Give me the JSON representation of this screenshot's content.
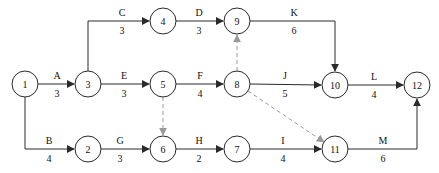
{
  "diagram": {
    "type": "activity-on-arrow-network",
    "width": 439,
    "height": 173,
    "colors": {
      "background": "#ffffff",
      "node_fill": "#ffffff",
      "solid_stroke": "#2a2a2a",
      "dashed_stroke": "#9a9a9a",
      "text": "#111111"
    },
    "node_radius": 13,
    "nodes": [
      {
        "id": "1",
        "x": 25,
        "y": 84
      },
      {
        "id": "2",
        "x": 88,
        "y": 149
      },
      {
        "id": "3",
        "x": 88,
        "y": 84
      },
      {
        "id": "4",
        "x": 163,
        "y": 21
      },
      {
        "id": "5",
        "x": 163,
        "y": 84
      },
      {
        "id": "6",
        "x": 163,
        "y": 149
      },
      {
        "id": "7",
        "x": 237,
        "y": 149
      },
      {
        "id": "8",
        "x": 237,
        "y": 84
      },
      {
        "id": "9",
        "x": 237,
        "y": 21
      },
      {
        "id": "10",
        "x": 335,
        "y": 85
      },
      {
        "id": "11",
        "x": 335,
        "y": 149
      },
      {
        "id": "12",
        "x": 417,
        "y": 85
      }
    ],
    "edges": [
      {
        "activity": "A",
        "duration": "3",
        "from": "1",
        "to": "3",
        "style": "solid",
        "points": [
          [
            38,
            84
          ],
          [
            74,
            84
          ]
        ],
        "label_x": 57,
        "label_line_y": 84
      },
      {
        "activity": "B",
        "duration": "4",
        "from": "1",
        "to": "2",
        "style": "solid",
        "points": [
          [
            25,
            97
          ],
          [
            25,
            149
          ],
          [
            74,
            149
          ]
        ],
        "label_x": 49,
        "label_line_y": 149
      },
      {
        "activity": "C",
        "duration": "3",
        "from": "3",
        "to": "4",
        "style": "solid",
        "points": [
          [
            88,
            71
          ],
          [
            88,
            21
          ],
          [
            149,
            21
          ]
        ],
        "label_x": 122,
        "label_line_y": 21
      },
      {
        "activity": "D",
        "duration": "3",
        "from": "4",
        "to": "9",
        "style": "solid",
        "points": [
          [
            176,
            21
          ],
          [
            223,
            21
          ]
        ],
        "label_x": 199,
        "label_line_y": 21
      },
      {
        "activity": "E",
        "duration": "3",
        "from": "3",
        "to": "5",
        "style": "solid",
        "points": [
          [
            101,
            84
          ],
          [
            149,
            84
          ]
        ],
        "label_x": 124,
        "label_line_y": 84
      },
      {
        "activity": "F",
        "duration": "4",
        "from": "5",
        "to": "8",
        "style": "solid",
        "points": [
          [
            176,
            84
          ],
          [
            223,
            84
          ]
        ],
        "label_x": 200,
        "label_line_y": 84
      },
      {
        "activity": "G",
        "duration": "3",
        "from": "2",
        "to": "6",
        "style": "solid",
        "points": [
          [
            101,
            149
          ],
          [
            149,
            149
          ]
        ],
        "label_x": 120,
        "label_line_y": 149
      },
      {
        "activity": "H",
        "duration": "2",
        "from": "6",
        "to": "7",
        "style": "solid",
        "points": [
          [
            176,
            149
          ],
          [
            223,
            149
          ]
        ],
        "label_x": 199,
        "label_line_y": 149
      },
      {
        "activity": "I",
        "duration": "4",
        "from": "7",
        "to": "11",
        "style": "solid",
        "points": [
          [
            250,
            149
          ],
          [
            321,
            149
          ]
        ],
        "label_x": 283,
        "label_line_y": 149
      },
      {
        "activity": "J",
        "duration": "5",
        "from": "8",
        "to": "10",
        "style": "solid",
        "points": [
          [
            250,
            84
          ],
          [
            321,
            85
          ]
        ],
        "label_x": 285,
        "label_line_y": 84
      },
      {
        "activity": "K",
        "duration": "6",
        "from": "9",
        "to": "10",
        "style": "solid",
        "points": [
          [
            250,
            21
          ],
          [
            335,
            21
          ],
          [
            335,
            71
          ]
        ],
        "label_x": 294,
        "label_line_y": 21
      },
      {
        "activity": "L",
        "duration": "4",
        "from": "10",
        "to": "12",
        "style": "solid",
        "points": [
          [
            348,
            85
          ],
          [
            403,
            85
          ]
        ],
        "label_x": 374,
        "label_line_y": 85
      },
      {
        "activity": "M",
        "duration": "6",
        "from": "11",
        "to": "12",
        "style": "solid",
        "points": [
          [
            348,
            149
          ],
          [
            417,
            149
          ],
          [
            417,
            99
          ]
        ],
        "label_x": 383,
        "label_line_y": 149
      },
      {
        "activity": "",
        "duration": "",
        "from": "5",
        "to": "6",
        "style": "dashed",
        "points": [
          [
            163,
            97
          ],
          [
            163,
            135
          ]
        ],
        "label_x": null,
        "label_line_y": null
      },
      {
        "activity": "",
        "duration": "",
        "from": "8",
        "to": "9",
        "style": "dashed",
        "points": [
          [
            237,
            71
          ],
          [
            237,
            35
          ]
        ],
        "label_x": null,
        "label_line_y": null
      },
      {
        "activity": "",
        "duration": "",
        "from": "8",
        "to": "11",
        "style": "dashed",
        "points": [
          [
            248,
            91
          ],
          [
            324,
            142
          ]
        ],
        "label_x": null,
        "label_line_y": null
      }
    ],
    "fonts": {
      "edge_label_size": 10,
      "node_label_size": 10
    }
  }
}
